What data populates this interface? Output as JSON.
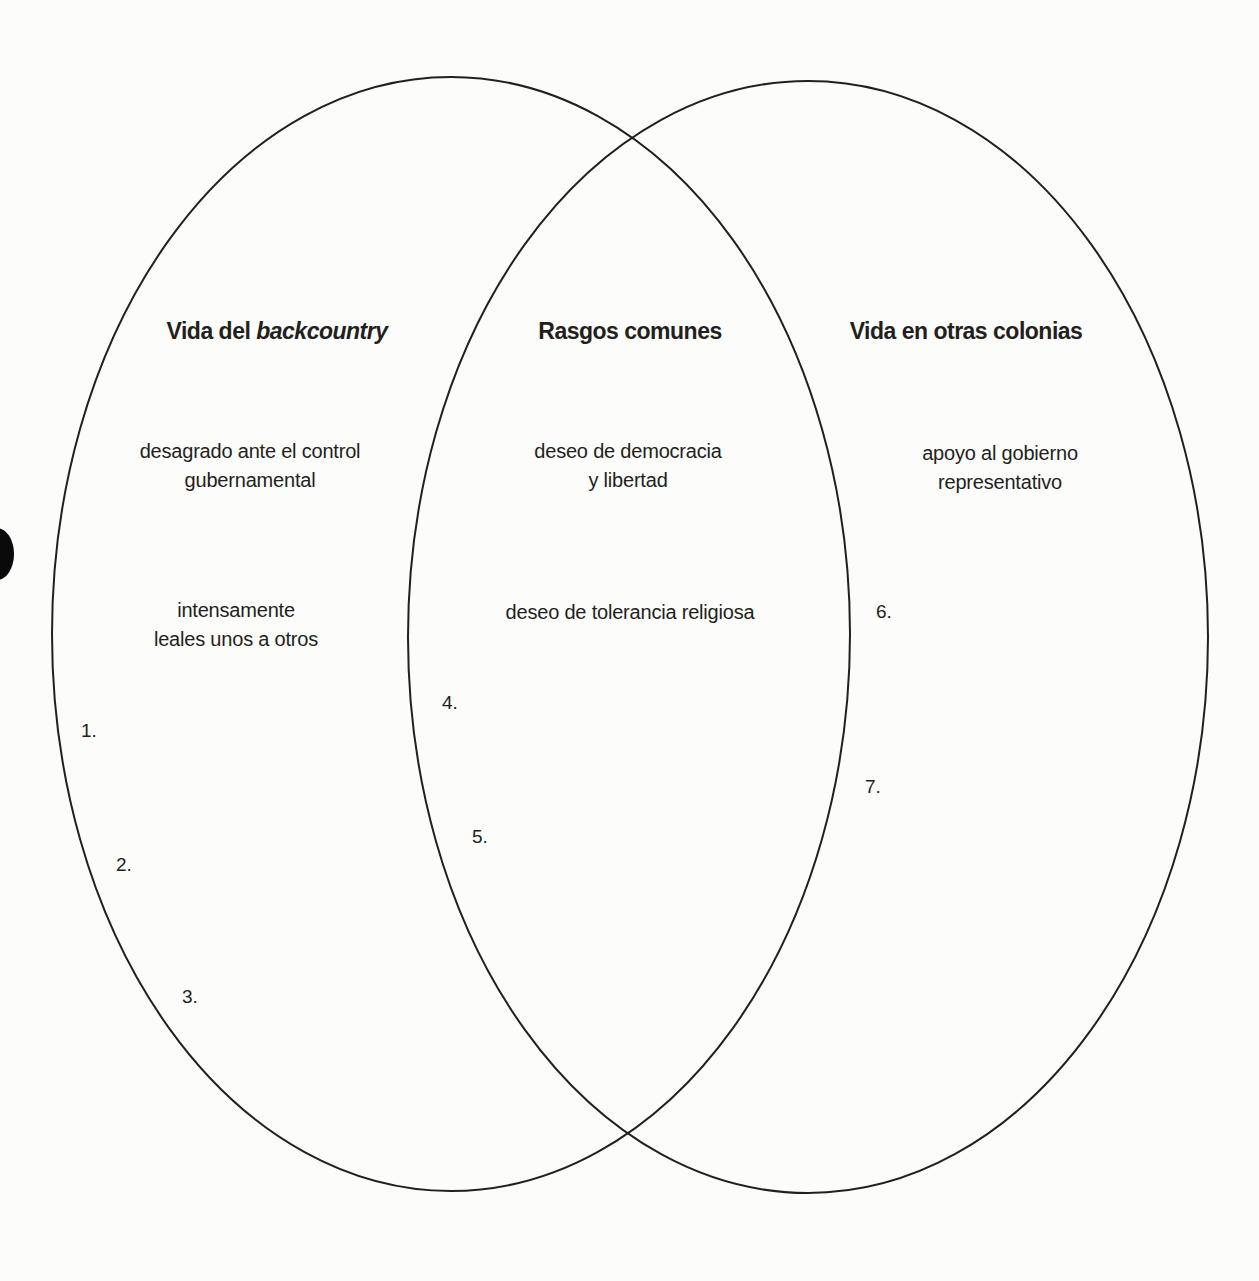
{
  "diagram": {
    "type": "venn",
    "line_color": "#231f20",
    "sets": [
      {
        "id": "left",
        "heading_prefix": "Vida del ",
        "heading_italic": "backcountry",
        "items": [
          "desagrado ante el control\ngubernamental",
          "intensamente\nleales unos a otros"
        ],
        "blanks": [
          "1.",
          "2.",
          "3."
        ]
      },
      {
        "id": "center",
        "heading": "Rasgos comunes",
        "items": [
          "deseo de democracia\ny libertad",
          "deseo de tolerancia religiosa"
        ],
        "blanks": [
          "4.",
          "5."
        ]
      },
      {
        "id": "right",
        "heading": "Vida en otras colonias",
        "items": [
          "apoyo al gobierno\nrepresentativo"
        ],
        "blanks": [
          "6.",
          "7."
        ]
      }
    ]
  }
}
